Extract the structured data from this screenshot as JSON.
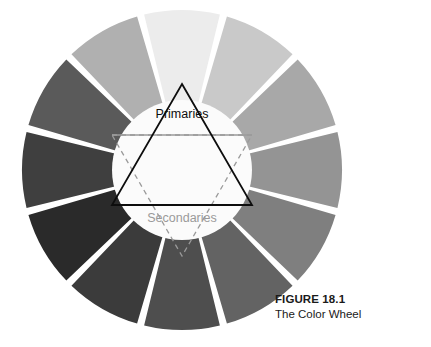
{
  "figure": {
    "caption_title": "FIGURE 18.1",
    "caption_subtitle": "The Color Wheel"
  },
  "wheel": {
    "labels": {
      "primaries": "Primaries",
      "secondaries": "Secondaries"
    },
    "center_x": 182,
    "center_y": 170,
    "outer_radius": 160,
    "inner_radius": 70,
    "segment_count": 12,
    "gap_degrees": 2.6,
    "gap_color": "#ffffff",
    "inner_circle_color": "#fbfbfb",
    "primaries_triangle_color": "#0d0d0d",
    "secondaries_triangle_color": "#9a9a9a"
  },
  "chart_data": {
    "type": "pie",
    "title": "The Color Wheel",
    "xlabel": "",
    "ylabel": "",
    "legend_position": "none",
    "grid": false,
    "categories": [
      "Yellow",
      "Yellow-Orange",
      "Orange",
      "Red-Orange",
      "Red",
      "Red-Violet",
      "Violet",
      "Blue-Violet",
      "Blue",
      "Blue-Green",
      "Green",
      "Yellow-Green"
    ],
    "values": [
      30,
      30,
      30,
      30,
      30,
      30,
      30,
      30,
      30,
      30,
      30,
      30
    ],
    "colors": [
      "#ececec",
      "#c9c9c9",
      "#a8a8a8",
      "#949494",
      "#7f7f7f",
      "#636363",
      "#4e4e4e",
      "#3b3b3b",
      "#2a2a2a",
      "#3f3f3f",
      "#5a5a5a",
      "#b0b0b0"
    ],
    "start_angle_degrees": -15
  }
}
